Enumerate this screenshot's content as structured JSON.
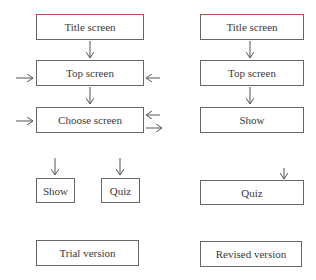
{
  "trial_version": {
    "label": "Trial version",
    "boxes": {
      "title": "Title screen",
      "top": "Top screen",
      "choose": "Choose screen",
      "show": "Show",
      "quiz": "Quiz"
    }
  },
  "revised_version": {
    "label": "Revised version",
    "boxes": {
      "title": "Title screen",
      "top": "Top screen",
      "show": "Show",
      "quiz": "Quiz"
    }
  },
  "colors": {
    "border": "#666666",
    "accent_top_border": "#c0504d",
    "arrow": "#555555"
  }
}
